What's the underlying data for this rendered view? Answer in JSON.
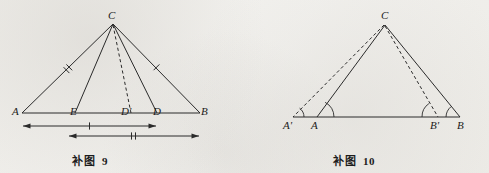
{
  "page": {
    "width": 489,
    "height": 173,
    "background_color": "#f2f1ee",
    "ink_color": "#2a2a2a"
  },
  "figures": [
    {
      "id": "figure-9",
      "caption_text": "补图",
      "caption_number": "9",
      "description": "Isosceles-style triangle ABC with cevians CE, CD and dashed cevian CD-prime, plus two dimension bars below base AB",
      "vertices": [
        {
          "name": "C",
          "label": "C",
          "x": 113,
          "y": 21
        },
        {
          "name": "A",
          "label": "A",
          "x": 22,
          "y": 113
        },
        {
          "name": "E",
          "label": "E",
          "x": 75,
          "y": 113
        },
        {
          "name": "Dp",
          "label": "D'",
          "x": 130,
          "y": 113
        },
        {
          "name": "D",
          "label": "D",
          "x": 157,
          "y": 113
        },
        {
          "name": "B",
          "label": "B",
          "x": 200,
          "y": 113
        }
      ],
      "segments": [
        {
          "name": "AC",
          "from": "A",
          "to": "C",
          "style": "solid",
          "ticks": 2
        },
        {
          "name": "CB",
          "from": "C",
          "to": "B",
          "style": "solid",
          "ticks": 1
        },
        {
          "name": "AB",
          "from": "A",
          "to": "B",
          "style": "solid",
          "ticks": 0
        },
        {
          "name": "CE",
          "from": "C",
          "to": "E",
          "style": "solid",
          "ticks": 0
        },
        {
          "name": "CD",
          "from": "C",
          "to": "D",
          "style": "solid",
          "ticks": 0
        },
        {
          "name": "CDp",
          "from": "C",
          "to": "Dp",
          "style": "dashed",
          "ticks": 0
        }
      ],
      "dimensions": [
        {
          "name": "dim-upper",
          "from_x": 22,
          "to_x": 157,
          "y": 126,
          "ticks": 1,
          "arrows": "both"
        },
        {
          "name": "dim-lower",
          "from_x": 68,
          "to_x": 200,
          "y": 136,
          "ticks": 2,
          "arrows": "both"
        }
      ]
    },
    {
      "id": "figure-10",
      "caption_text": "补图",
      "caption_number": "10",
      "description": "Triangle ABC on baseline with extended point A-prime left of A and B-prime left of B, dashed segments CA-prime and CB-prime, angle arcs at A-prime, A, B-prime, B",
      "vertices": [
        {
          "name": "C",
          "label": "C",
          "x": 140,
          "y": 22
        },
        {
          "name": "Ap",
          "label": "A'",
          "x": 48,
          "y": 117
        },
        {
          "name": "A",
          "label": "A",
          "x": 72,
          "y": 117
        },
        {
          "name": "Bp",
          "label": "B'",
          "x": 193,
          "y": 117
        },
        {
          "name": "B",
          "label": "B",
          "x": 215,
          "y": 117
        }
      ],
      "segments": [
        {
          "name": "AC",
          "from": "A",
          "to": "C",
          "style": "solid",
          "ticks": 0
        },
        {
          "name": "CB",
          "from": "C",
          "to": "B",
          "style": "solid",
          "ticks": 0
        },
        {
          "name": "ApB",
          "from": "Ap",
          "to": "B",
          "style": "solid",
          "ticks": 0
        },
        {
          "name": "CAp",
          "from": "C",
          "to": "Ap",
          "style": "dashed",
          "ticks": 0
        },
        {
          "name": "CBp",
          "from": "C",
          "to": "Bp",
          "style": "dashed",
          "ticks": 0
        }
      ],
      "angle_arcs": [
        {
          "name": "angle-at-A-prime",
          "at": "Ap",
          "radius": 11
        },
        {
          "name": "angle-at-A",
          "at": "A",
          "radius": 17
        },
        {
          "name": "angle-at-B-prime",
          "at": "Bp",
          "radius": 16
        },
        {
          "name": "angle-at-B",
          "at": "B",
          "radius": 14
        }
      ]
    }
  ]
}
